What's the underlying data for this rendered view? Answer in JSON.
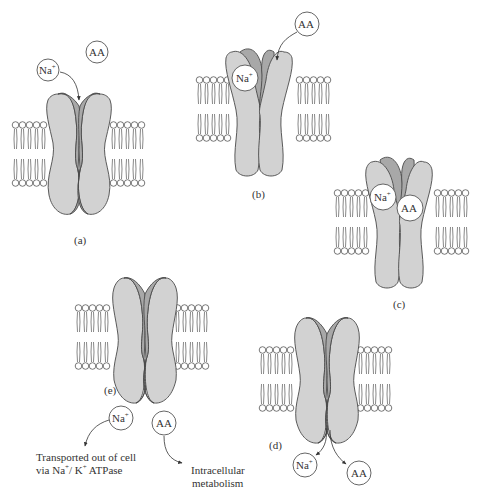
{
  "figure": {
    "colors": {
      "protein_light": "#d2d2d2",
      "protein_dark": "#a8a8a8",
      "outline": "#4a4a4a",
      "lipid": "#555555",
      "text": "#333333"
    },
    "panels": {
      "a": {
        "label": "(a)",
        "na": "Na",
        "na_sup": "+",
        "aa": "AA"
      },
      "b": {
        "label": "(b)",
        "na": "Na",
        "na_sup": "+",
        "aa": "AA"
      },
      "c": {
        "label": "(c)",
        "na": "Na",
        "na_sup": "+",
        "aa": "AA"
      },
      "d": {
        "label": "(d)",
        "na": "Na",
        "na_sup": "+",
        "aa": "AA"
      },
      "e": {
        "label": "(e)",
        "na": "Na",
        "na_sup": "+",
        "aa": "AA",
        "na_fate_line1": "Transported out of cell",
        "na_fate_line2_a": "via Na",
        "na_fate_line2_sup1": "+",
        "na_fate_line2_b": "/ K",
        "na_fate_line2_sup2": "+",
        "na_fate_line2_c": " ATPase",
        "aa_fate_line1": "Intracellular",
        "aa_fate_line2": "metabolism"
      }
    }
  }
}
